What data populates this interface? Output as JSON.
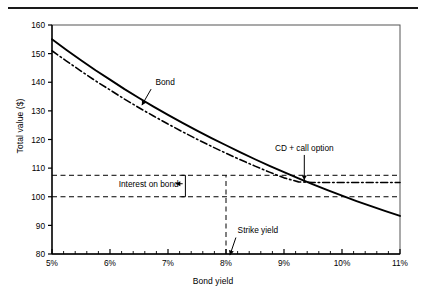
{
  "figure": {
    "has_top_rule": true,
    "background": "#ffffff",
    "line_color": "#000000"
  },
  "chart_data": {
    "type": "line",
    "title": "",
    "xlabel": "Bond yield",
    "ylabel": "Total value ($)",
    "xlim": [
      5,
      11
    ],
    "ylim": [
      80,
      160
    ],
    "xticks": [
      "5%",
      "6%",
      "7%",
      "8%",
      "9%",
      "10%",
      "11%"
    ],
    "xtick_values": [
      5,
      6,
      7,
      8,
      9,
      10,
      11
    ],
    "minor_xtick_interval": 0.2,
    "yticks": [
      "80",
      "90",
      "100",
      "110",
      "120",
      "130",
      "140",
      "150",
      "160"
    ],
    "ytick_values": [
      80,
      90,
      100,
      110,
      120,
      130,
      140,
      150,
      160
    ],
    "grid": false,
    "legend_position": "inline-annotations",
    "x": [
      5.0,
      5.25,
      5.5,
      5.75,
      6.0,
      6.25,
      6.5,
      6.75,
      7.0,
      7.25,
      7.5,
      7.75,
      8.0,
      8.25,
      8.5,
      8.75,
      9.0,
      9.25,
      9.5,
      9.75,
      10.0,
      10.25,
      10.5,
      10.75,
      11.0
    ],
    "series": [
      {
        "name": "Bond",
        "style": "solid",
        "values": [
          155.0,
          151.3,
          147.7,
          144.2,
          140.9,
          137.6,
          134.5,
          131.5,
          128.6,
          125.8,
          123.1,
          120.5,
          118.0,
          115.5,
          113.1,
          110.8,
          108.6,
          106.4,
          104.3,
          102.3,
          100.4,
          98.5,
          96.7,
          95.0,
          93.3
        ]
      },
      {
        "name": "CD + call option",
        "style": "dash-dot",
        "values": [
          151.0,
          147.4,
          143.9,
          140.5,
          137.3,
          134.1,
          131.1,
          128.2,
          125.4,
          122.7,
          120.1,
          117.6,
          115.2,
          112.9,
          110.7,
          108.6,
          106.6,
          105.2,
          105.0,
          105.0,
          105.0,
          105.0,
          105.0,
          105.0,
          105.0
        ]
      }
    ],
    "reference_lines": [
      {
        "name": "bond-upper-dashed",
        "orientation": "horizontal",
        "value": 107.5,
        "style": "dashed"
      },
      {
        "name": "par-dashed",
        "orientation": "horizontal",
        "value": 100.0,
        "style": "dashed"
      },
      {
        "name": "strike-yield-vertical",
        "orientation": "vertical",
        "value": 8.0,
        "style": "dashed"
      }
    ],
    "annotations": [
      {
        "name": "bond-label",
        "text": "Bond",
        "x": 6.95,
        "y": 139.0,
        "arrow_to_x": 6.55,
        "arrow_to_y": 132.0
      },
      {
        "name": "cd-call-option-label",
        "text": "CD + call option",
        "x": 9.35,
        "y": 116.0,
        "arrow_to_x": 9.35,
        "arrow_to_y": 105.5
      },
      {
        "name": "interest-on-bond-label",
        "text": "Interest on bond",
        "x": 6.15,
        "y": 103.5,
        "arrow_to_x": 7.15,
        "arrow_to_y": 103.5
      },
      {
        "name": "strike-yield-label",
        "text": "Strike yield",
        "x": 8.55,
        "y": 87.5,
        "arrow_to_x": 8.05,
        "arrow_to_y": 81.0
      }
    ],
    "brackets": [
      {
        "name": "interest-on-bond-bracket",
        "x": 7.3,
        "y_top": 107.5,
        "y_bottom": 100.0
      }
    ]
  }
}
